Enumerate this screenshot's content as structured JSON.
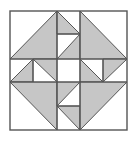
{
  "diagram": {
    "colors": {
      "background": "#ffffff",
      "fill": "#c6c6c6",
      "stroke": "#555555"
    },
    "outer_square": {
      "x": 10,
      "y": 11,
      "width": 117,
      "height": 119
    },
    "grid_lines": [
      {
        "x1": 57,
        "y1": 11,
        "x2": 57,
        "y2": 130
      },
      {
        "x1": 80,
        "y1": 11,
        "x2": 80,
        "y2": 130
      },
      {
        "x1": 10,
        "y1": 59,
        "x2": 127,
        "y2": 59
      },
      {
        "x1": 10,
        "y1": 82,
        "x2": 127,
        "y2": 82
      }
    ],
    "shaded_triangles": [
      {
        "name": "top-left-large",
        "points": "10,59 57,11 57,59"
      },
      {
        "name": "top-middle-upper",
        "points": "57,11 80,34 57,34"
      },
      {
        "name": "top-middle-lower",
        "points": "80,34 80,59 57,59"
      },
      {
        "name": "top-right-large",
        "points": "80,11 127,59 80,59"
      },
      {
        "name": "middle-left-outer",
        "points": "10,82 33,59 33,82"
      },
      {
        "name": "middle-left-inner",
        "points": "33,59 57,59 57,82"
      },
      {
        "name": "middle-right-inner",
        "points": "80,59 103,82 80,82"
      },
      {
        "name": "middle-right-outer",
        "points": "103,59 127,59 103,82"
      },
      {
        "name": "bottom-left-large",
        "points": "10,82 57,82 57,130"
      },
      {
        "name": "bottom-middle-upper",
        "points": "57,82 80,82 57,106"
      },
      {
        "name": "bottom-middle-lower",
        "points": "57,106 80,106 80,130"
      },
      {
        "name": "bottom-right-large",
        "points": "80,82 127,82 80,130"
      }
    ],
    "extra_lines": [
      {
        "x1": 57,
        "y1": 34,
        "x2": 80,
        "y2": 34
      },
      {
        "x1": 33,
        "y1": 59,
        "x2": 33,
        "y2": 82
      },
      {
        "x1": 103,
        "y1": 59,
        "x2": 103,
        "y2": 82
      },
      {
        "x1": 57,
        "y1": 106,
        "x2": 80,
        "y2": 106
      }
    ]
  }
}
